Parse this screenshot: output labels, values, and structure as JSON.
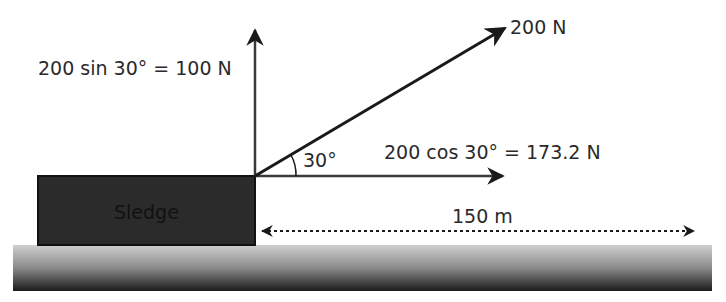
{
  "diagram": {
    "labels": {
      "vertical_component": "200 sin 30° = 100 N",
      "applied_force": "200 N",
      "angle": "30°",
      "horizontal_component": "200 cos 30° = 173.2 N",
      "object": "Sledge",
      "distance": "150 m"
    },
    "values": {
      "force_N": 200,
      "angle_deg": 30,
      "vertical_N": 100,
      "horizontal_N": 173.2,
      "distance_m": 150
    },
    "colors": {
      "arrow": "#1a1a1a",
      "component_arrow": "#3a3a3a",
      "sledge_fill": "#2b2b2b",
      "ground_top": "#c8c8c8",
      "ground_bottom": "#1e1e1e",
      "text": "#2a2a2a"
    }
  }
}
